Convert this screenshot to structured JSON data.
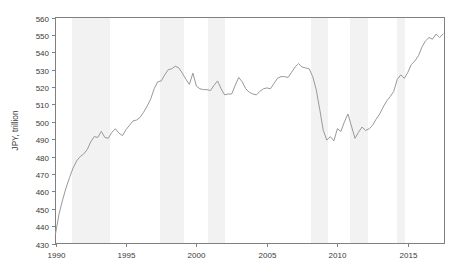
{
  "chart_data": {
    "type": "line",
    "title": "",
    "subtitle": "",
    "xlabel": "",
    "ylabel": "JPY, trillion",
    "xlim": [
      1990.0,
      2017.6
    ],
    "ylim": [
      430,
      560
    ],
    "grid": false,
    "legend": null,
    "legend_position": "none",
    "y_ticks": [
      430,
      440,
      450,
      460,
      470,
      480,
      490,
      500,
      510,
      520,
      530,
      540,
      550,
      560
    ],
    "y_tick_labels": [
      "430",
      "440",
      "450",
      "460",
      "470",
      "480",
      "490",
      "500",
      "510",
      "520",
      "530",
      "540",
      "550",
      "560"
    ],
    "x_ticks": [
      1990,
      1995,
      2000,
      2005,
      2010,
      2015
    ],
    "x_tick_labels": [
      "1990",
      "1995",
      "2000",
      "2005",
      "2010",
      "2015"
    ],
    "line_color": "#999999",
    "line_width": 1.0,
    "shade_color": "#f2f2f2",
    "axis_color": "#808080",
    "shaded_regions": [
      {
        "start": 1991.2,
        "end": 1993.9,
        "label": "recession"
      },
      {
        "start": 1997.4,
        "end": 1999.1,
        "label": "recession"
      },
      {
        "start": 2000.8,
        "end": 2002.0,
        "label": "recession"
      },
      {
        "start": 2008.1,
        "end": 2009.3,
        "label": "recession"
      },
      {
        "start": 2010.9,
        "end": 2012.2,
        "label": "recession"
      },
      {
        "start": 2014.2,
        "end": 2014.8,
        "label": "recession"
      }
    ],
    "series": [
      {
        "name": "JPY, trillion",
        "x": [
          1990.0,
          1990.25,
          1990.5,
          1990.75,
          1991.0,
          1991.25,
          1991.5,
          1991.75,
          1992.0,
          1992.25,
          1992.5,
          1992.75,
          1993.0,
          1993.25,
          1993.5,
          1993.75,
          1994.0,
          1994.25,
          1994.5,
          1994.75,
          1995.0,
          1995.25,
          1995.5,
          1995.75,
          1996.0,
          1996.25,
          1996.5,
          1996.75,
          1997.0,
          1997.25,
          1997.5,
          1997.75,
          1998.0,
          1998.25,
          1998.5,
          1998.75,
          1999.0,
          1999.25,
          1999.5,
          1999.75,
          2000.0,
          2000.25,
          2000.5,
          2000.75,
          2001.0,
          2001.25,
          2001.5,
          2001.75,
          2002.0,
          2002.25,
          2002.5,
          2002.75,
          2003.0,
          2003.25,
          2003.5,
          2003.75,
          2004.0,
          2004.25,
          2004.5,
          2004.75,
          2005.0,
          2005.25,
          2005.5,
          2005.75,
          2006.0,
          2006.25,
          2006.5,
          2006.75,
          2007.0,
          2007.25,
          2007.5,
          2007.75,
          2008.0,
          2008.25,
          2008.5,
          2008.75,
          2009.0,
          2009.25,
          2009.5,
          2009.75,
          2010.0,
          2010.25,
          2010.5,
          2010.75,
          2011.0,
          2011.25,
          2011.5,
          2011.75,
          2012.0,
          2012.25,
          2012.5,
          2012.75,
          2013.0,
          2013.25,
          2013.5,
          2013.75,
          2014.0,
          2014.25,
          2014.5,
          2014.75,
          2015.0,
          2015.25,
          2015.5,
          2015.75,
          2016.0,
          2016.25,
          2016.5,
          2016.75,
          2017.0,
          2017.25,
          2017.5
        ],
        "values": [
          435.5,
          447.0,
          455.0,
          462.0,
          468.0,
          473.5,
          477.5,
          480.0,
          481.5,
          484.0,
          488.5,
          491.5,
          491.0,
          494.5,
          491.0,
          490.5,
          494.0,
          496.0,
          493.5,
          492.0,
          495.5,
          498.0,
          500.5,
          501.0,
          502.5,
          505.5,
          509.0,
          513.0,
          519.0,
          523.0,
          523.5,
          527.0,
          530.0,
          530.5,
          532.0,
          531.0,
          528.0,
          524.5,
          521.5,
          528.0,
          520.5,
          519.0,
          518.5,
          518.5,
          518.0,
          521.0,
          523.5,
          519.0,
          515.5,
          516.0,
          516.0,
          521.0,
          525.5,
          523.0,
          519.0,
          517.0,
          516.0,
          515.5,
          517.5,
          519.0,
          519.5,
          519.0,
          522.0,
          525.0,
          526.0,
          526.0,
          525.5,
          528.5,
          531.5,
          533.5,
          531.5,
          531.0,
          530.5,
          526.0,
          518.5,
          507.0,
          495.0,
          489.5,
          491.5,
          489.0,
          496.0,
          494.5,
          500.0,
          504.5,
          497.5,
          490.5,
          494.0,
          497.0,
          495.0,
          496.0,
          498.0,
          501.5,
          504.5,
          508.5,
          512.0,
          514.5,
          517.5,
          524.5,
          527.0,
          525.0,
          528.5,
          533.0,
          535.0,
          538.0,
          543.0,
          546.5,
          548.5,
          547.5,
          550.5,
          548.5,
          550.5
        ]
      }
    ]
  }
}
